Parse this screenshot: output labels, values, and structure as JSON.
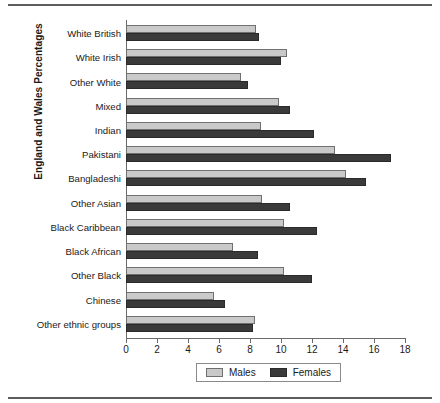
{
  "chart_data": {
    "type": "bar",
    "orientation": "horizontal",
    "title": "",
    "xlabel": "",
    "ylabel": "England and Wales Percentages",
    "xlim": [
      0,
      18
    ],
    "xticks": [
      0,
      2,
      4,
      6,
      8,
      10,
      12,
      14,
      16,
      18
    ],
    "xtick_labels": [
      "0",
      "2",
      "4",
      "6",
      "8",
      "10",
      "12",
      "14",
      "16",
      "18"
    ],
    "grid": false,
    "legend_position": "bottom-center",
    "categories": [
      "White British",
      "White Irish",
      "Other White",
      "Mixed",
      "Indian",
      "Pakistani",
      "Bangladeshi",
      "Other Asian",
      "Black Caribbean",
      "Black African",
      "Other Black",
      "Chinese",
      "Other ethnic groups"
    ],
    "series": [
      {
        "name": "Males",
        "color": "#c9c9c9",
        "values": [
          8.4,
          10.4,
          7.4,
          9.9,
          8.7,
          13.5,
          14.2,
          8.8,
          10.2,
          6.9,
          10.2,
          5.7,
          8.3
        ]
      },
      {
        "name": "Females",
        "color": "#3a3a3a",
        "values": [
          8.6,
          10.0,
          7.9,
          10.6,
          12.1,
          17.1,
          15.5,
          10.6,
          12.3,
          8.5,
          12.0,
          6.4,
          8.2
        ]
      }
    ]
  },
  "legend": {
    "items": [
      {
        "label": "Males",
        "swatch": "males"
      },
      {
        "label": "Females",
        "swatch": "females"
      }
    ]
  }
}
